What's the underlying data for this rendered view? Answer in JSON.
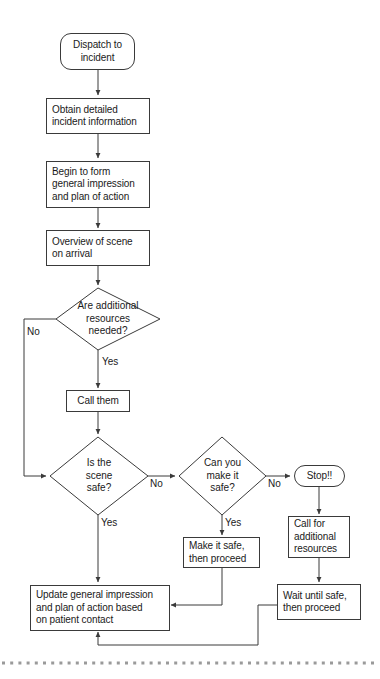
{
  "diagram": {
    "type": "flowchart",
    "colors": {
      "stroke": "#3a3a3a",
      "text": "#1a1a1a",
      "background": "#ffffff",
      "dotted_rule": "#9a9a9a"
    },
    "nodes": [
      {
        "id": "dispatch",
        "shape": "terminal",
        "text": "Dispatch to\nincident",
        "line1": "Dispatch to",
        "line2": "incident"
      },
      {
        "id": "obtain",
        "shape": "process",
        "text": "Obtain detailed incident information",
        "line1": "Obtain detailed",
        "line2": "incident information"
      },
      {
        "id": "begin",
        "shape": "process",
        "text": "Begin to form general impression and plan of action",
        "line1": "Begin to form",
        "line2": "general impression",
        "line3": "and plan of action"
      },
      {
        "id": "overview",
        "shape": "process",
        "text": "Overview of scene on arrival",
        "line1": "Overview of scene",
        "line2": "on arrival"
      },
      {
        "id": "resources",
        "shape": "decision",
        "text": "Are additional resources needed?",
        "line1": "Are additional",
        "line2": "resources",
        "line3": "needed?"
      },
      {
        "id": "callthem",
        "shape": "process",
        "text": "Call them",
        "line1": "Call them"
      },
      {
        "id": "scenesafe",
        "shape": "decision",
        "text": "Is the scene safe?",
        "line1": "Is the",
        "line2": "scene",
        "line3": "safe?"
      },
      {
        "id": "canmakesafe",
        "shape": "decision",
        "text": "Can you make it safe?",
        "line1": "Can you",
        "line2": "make it",
        "line3": "safe?"
      },
      {
        "id": "stop",
        "shape": "terminal",
        "text": "Stop!!",
        "line1": "Stop!!"
      },
      {
        "id": "makeitsafe",
        "shape": "process",
        "text": "Make it safe, then proceed",
        "line1": "Make it safe,",
        "line2": "then proceed"
      },
      {
        "id": "callforadd",
        "shape": "process",
        "text": "Call for additional resources",
        "line1": "Call for",
        "line2": "additional",
        "line3": "resources"
      },
      {
        "id": "waituntilsafe",
        "shape": "process",
        "text": "Wait until safe, then proceed",
        "line1": "Wait until safe,",
        "line2": "then proceed"
      },
      {
        "id": "update",
        "shape": "process",
        "text": "Update general impression and plan of action based on patient contact",
        "line1": "Update general impression",
        "line2": "and plan of action based",
        "line3": "on patient contact"
      }
    ],
    "edge_labels": {
      "resources_no": "No",
      "resources_yes": "Yes",
      "scenesafe_no": "No",
      "scenesafe_yes": "Yes",
      "canmakesafe_no": "No",
      "canmakesafe_yes": "Yes"
    },
    "edges": [
      {
        "from": "dispatch",
        "to": "obtain",
        "label": ""
      },
      {
        "from": "obtain",
        "to": "begin",
        "label": ""
      },
      {
        "from": "begin",
        "to": "overview",
        "label": ""
      },
      {
        "from": "overview",
        "to": "resources",
        "label": ""
      },
      {
        "from": "resources",
        "to": "scenesafe",
        "label": "No"
      },
      {
        "from": "resources",
        "to": "callthem",
        "label": "Yes"
      },
      {
        "from": "callthem",
        "to": "scenesafe",
        "label": ""
      },
      {
        "from": "scenesafe",
        "to": "canmakesafe",
        "label": "No"
      },
      {
        "from": "scenesafe",
        "to": "update",
        "label": "Yes"
      },
      {
        "from": "canmakesafe",
        "to": "stop",
        "label": "No"
      },
      {
        "from": "canmakesafe",
        "to": "makeitsafe",
        "label": "Yes"
      },
      {
        "from": "stop",
        "to": "callforadd",
        "label": ""
      },
      {
        "from": "callforadd",
        "to": "waituntilsafe",
        "label": ""
      },
      {
        "from": "makeitsafe",
        "to": "update",
        "label": ""
      },
      {
        "from": "waituntilsafe",
        "to": "update",
        "label": ""
      }
    ]
  }
}
